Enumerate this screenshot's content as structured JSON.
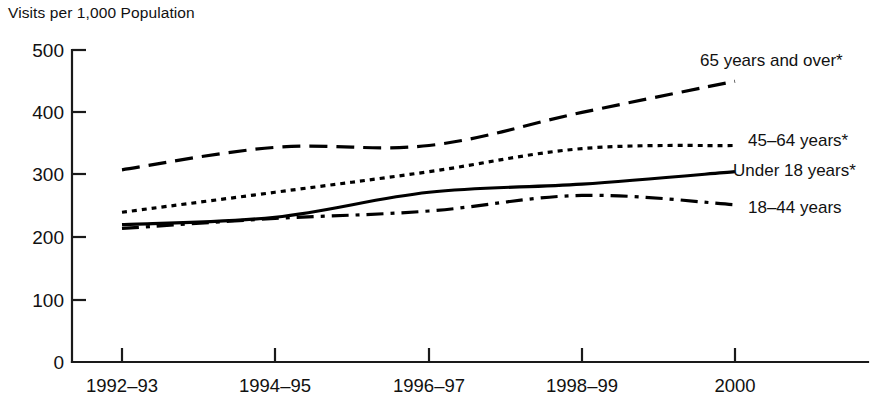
{
  "chart_data": {
    "type": "line",
    "title": "",
    "ylabel": "Visits per 1,000 Population",
    "xlabel": "",
    "categories": [
      "1992–93",
      "1994–95",
      "1996–97",
      "1998–99",
      "2000"
    ],
    "yticks": [
      0,
      100,
      200,
      300,
      400,
      500
    ],
    "ylim": [
      0,
      500
    ],
    "grid": false,
    "legend_position": "right-inline",
    "series": [
      {
        "name": "65 years and over*",
        "style": "dashed",
        "values": [
          308,
          344,
          347,
          400,
          450
        ]
      },
      {
        "name": "45–64 years*",
        "style": "dotted",
        "values": [
          240,
          272,
          305,
          342,
          347
        ]
      },
      {
        "name": "Under 18 years*",
        "style": "solid",
        "values": [
          220,
          232,
          272,
          285,
          305
        ]
      },
      {
        "name": "18–44 years",
        "style": "dash-dot",
        "values": [
          214,
          230,
          242,
          267,
          252
        ]
      }
    ]
  },
  "axis": {
    "y_title": "Visits per 1,000 Population",
    "y_tick_labels": [
      "500",
      "400",
      "300",
      "200",
      "100",
      "0"
    ],
    "x_tick_labels": [
      "1992–93",
      "1994–95",
      "1996–97",
      "1998–99",
      "2000"
    ]
  },
  "legend": {
    "items": [
      {
        "label": "65 years and over*"
      },
      {
        "label": "45–64 years*"
      },
      {
        "label": "Under 18 years*"
      },
      {
        "label": "18–44 years"
      }
    ]
  },
  "colors": {
    "ink": "#111111",
    "line": "#000000",
    "background": "#ffffff"
  }
}
